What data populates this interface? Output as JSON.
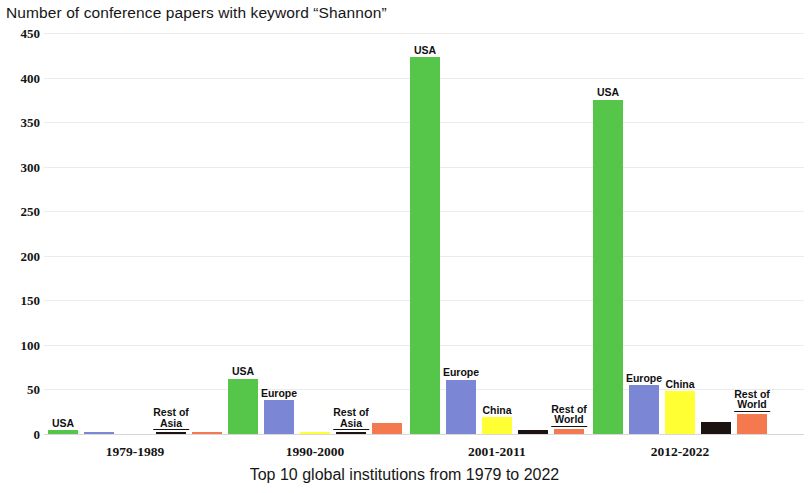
{
  "chart_data": {
    "type": "bar",
    "title": "Number of conference papers with keyword “Shannon”",
    "xlabel": "Top 10 global institutions from 1979 to 2022",
    "ylabel": "",
    "ylim": [
      0,
      450
    ],
    "ytick_step": 50,
    "yticks": [
      "450",
      "400",
      "350",
      "300",
      "250",
      "200",
      "150",
      "100",
      "50",
      "0"
    ],
    "grid": true,
    "legend": "none (bars annotated directly)",
    "categories": [
      "1979-1989",
      "1990-2000",
      "2001-2011",
      "2012-2022"
    ],
    "series": [
      {
        "name": "USA",
        "color": "#56c64a",
        "values": [
          4,
          62,
          423,
          375
        ]
      },
      {
        "name": "Europe",
        "color": "#7b87d4",
        "values": [
          1,
          38,
          61,
          55
        ]
      },
      {
        "name": "China",
        "color": "#ffff33",
        "values": [
          0,
          1,
          19,
          48
        ]
      },
      {
        "name": "Rest of Asia",
        "color": "#1a1310",
        "values": [
          1,
          1,
          4,
          14
        ]
      },
      {
        "name": "Rest of World",
        "color": "#f4794f",
        "values": [
          1,
          12,
          6,
          23
        ]
      }
    ],
    "bar_annotations": [
      {
        "group": "1979-1989",
        "series": "USA",
        "text": "USA"
      },
      {
        "group": "1979-1989",
        "series": "Rest of Asia",
        "text": "Rest of\nAsia"
      },
      {
        "group": "1990-2000",
        "series": "USA",
        "text": "USA"
      },
      {
        "group": "1990-2000",
        "series": "Europe",
        "text": "Europe"
      },
      {
        "group": "1990-2000",
        "series": "Rest of Asia",
        "text": "Rest of\nAsia"
      },
      {
        "group": "2001-2011",
        "series": "USA",
        "text": "USA"
      },
      {
        "group": "2001-2011",
        "series": "Europe",
        "text": "Europe"
      },
      {
        "group": "2001-2011",
        "series": "China",
        "text": "China"
      },
      {
        "group": "2001-2011",
        "series": "Rest of World",
        "text": "Rest of\nWorld"
      },
      {
        "group": "2012-2022",
        "series": "USA",
        "text": "USA"
      },
      {
        "group": "2012-2022",
        "series": "Europe",
        "text": "Europe"
      },
      {
        "group": "2012-2022",
        "series": "China",
        "text": "China"
      },
      {
        "group": "2012-2022",
        "series": "Rest of World",
        "text": "Rest of\nWorld"
      }
    ]
  },
  "layout": {
    "plot": {
      "left": 44,
      "top": 33,
      "width": 760,
      "height": 401
    },
    "group_centers": [
      135,
      315,
      497,
      680
    ],
    "bar_width": 30,
    "bar_gap": 6
  }
}
